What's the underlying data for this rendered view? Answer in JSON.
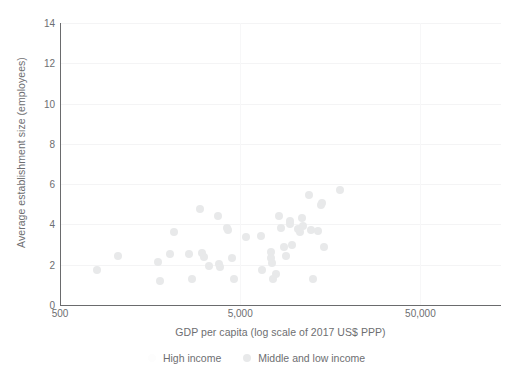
{
  "chart_data": {
    "type": "scatter",
    "title": "",
    "xlabel": "GDP per capita (log scale of 2017 US$ PPP)",
    "ylabel": "Average establishment size (employees)",
    "xscale": "log",
    "xlim": [
      500,
      140000
    ],
    "ylim": [
      0,
      14
    ],
    "xticks": [
      500,
      5000,
      50000
    ],
    "xtick_labels": [
      "500",
      "5,000",
      "50,000"
    ],
    "yticks": [
      0,
      2,
      4,
      6,
      8,
      10,
      12,
      14
    ],
    "ytick_labels": [
      "0",
      "2",
      "4",
      "6",
      "8",
      "10",
      "12",
      "14"
    ],
    "grid": "light horizontal and vertical gridlines",
    "legend_position": "bottom-center",
    "colors": {
      "middle_low_income": "#e8e9ea",
      "high_income": "#fdfdfd",
      "axis": "#6a6b6d",
      "text": "#6d6e71",
      "gridline": "#f4f4f5",
      "background": "#ffffff"
    },
    "series": [
      {
        "name": "High income",
        "color": "#fdfdfd",
        "points": []
      },
      {
        "name": "Middle and low income",
        "color": "#e8e9ea",
        "points": [
          [
            800,
            1.75
          ],
          [
            1050,
            2.45
          ],
          [
            1750,
            2.15
          ],
          [
            1800,
            1.2
          ],
          [
            2050,
            2.55
          ],
          [
            2150,
            3.6
          ],
          [
            2600,
            2.55
          ],
          [
            2700,
            1.3
          ],
          [
            3000,
            4.75
          ],
          [
            3050,
            2.6
          ],
          [
            3150,
            2.4
          ],
          [
            3350,
            1.95
          ],
          [
            3750,
            4.4
          ],
          [
            3800,
            2.05
          ],
          [
            3850,
            1.9
          ],
          [
            4250,
            3.8
          ],
          [
            4300,
            3.7
          ],
          [
            4500,
            2.35
          ],
          [
            4600,
            1.3
          ],
          [
            5400,
            3.4
          ],
          [
            6500,
            3.45
          ],
          [
            6600,
            1.75
          ],
          [
            7400,
            2.65
          ],
          [
            7450,
            2.35
          ],
          [
            7500,
            2.1
          ],
          [
            7600,
            1.3
          ],
          [
            7900,
            1.55
          ],
          [
            8200,
            4.4
          ],
          [
            8400,
            3.8
          ],
          [
            8700,
            2.9
          ],
          [
            9000,
            2.45
          ],
          [
            9400,
            4.15
          ],
          [
            9500,
            4.0
          ],
          [
            9700,
            3.0
          ],
          [
            10500,
            3.75
          ],
          [
            10700,
            3.6
          ],
          [
            11000,
            4.3
          ],
          [
            11200,
            3.9
          ],
          [
            12000,
            5.45
          ],
          [
            12400,
            3.7
          ],
          [
            12600,
            1.3
          ],
          [
            13500,
            3.65
          ],
          [
            14000,
            4.95
          ],
          [
            14300,
            5.05
          ],
          [
            14600,
            2.9
          ],
          [
            18000,
            5.7
          ]
        ]
      }
    ]
  },
  "axes": {
    "y_title": "Average establishment size (employees)",
    "x_title": "GDP per capita (log scale of 2017 US$ PPP)"
  },
  "legend": {
    "items": [
      {
        "label": "High income",
        "color": "#fdfdfd"
      },
      {
        "label": "Middle and low income",
        "color": "#e8e9ea"
      }
    ]
  }
}
